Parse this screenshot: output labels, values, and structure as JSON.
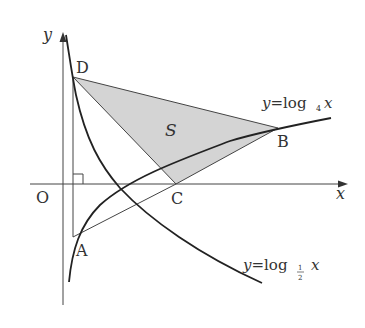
{
  "diagram": {
    "axes": {
      "x_label": "x",
      "y_label": "y",
      "origin_label": "O"
    },
    "points": {
      "A": {
        "label": "A",
        "x": 73,
        "y": 237
      },
      "B": {
        "label": "B",
        "x": 278,
        "y": 128
      },
      "C": {
        "label": "C",
        "x": 176,
        "y": 184
      },
      "D": {
        "label": "D",
        "x": 73,
        "y": 77
      }
    },
    "region_label": "S",
    "curves": {
      "log4": {
        "prefix": "y=log",
        "sub": "4",
        "suffix": " x"
      },
      "log_half": {
        "prefix": "y=log",
        "sub_num": "1",
        "sub_den": "2",
        "suffix": " x"
      }
    },
    "colors": {
      "shade": "#d4d4d4",
      "line": "#222222",
      "thin": "#444444"
    }
  }
}
